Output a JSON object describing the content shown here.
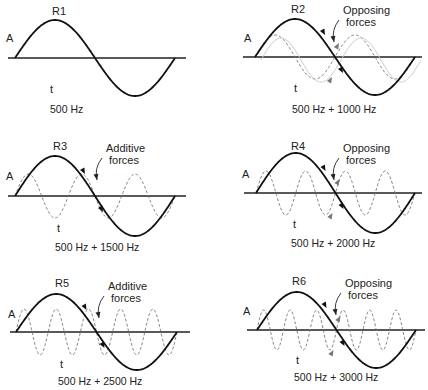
{
  "figure": {
    "panels": [
      {
        "id": "R1",
        "label": "R1",
        "amp_label": "A",
        "time_label": "t",
        "caption": "500 Hz",
        "overlay_freq_ratio": 0,
        "annotation": ""
      },
      {
        "id": "R2",
        "label": "R2",
        "amp_label": "A",
        "time_label": "t",
        "caption": "500 Hz + 1000 Hz",
        "overlay_freq_ratio": 2,
        "annotation": "Opposing forces",
        "annotation_lines": [
          "Opposing",
          "forces"
        ]
      },
      {
        "id": "R3",
        "label": "R3",
        "amp_label": "A",
        "time_label": "t",
        "caption": "500 Hz + 1500 Hz",
        "overlay_freq_ratio": 3,
        "annotation": "Additive forces",
        "annotation_lines": [
          "Additive",
          "forces"
        ]
      },
      {
        "id": "R4",
        "label": "R4",
        "amp_label": "A",
        "time_label": "t",
        "caption": "500 Hz + 2000 Hz",
        "overlay_freq_ratio": 4,
        "annotation": "Opposing forces",
        "annotation_lines": [
          "Opposing",
          "forces"
        ]
      },
      {
        "id": "R5",
        "label": "R5",
        "amp_label": "A",
        "time_label": "t",
        "caption": "500 Hz + 2500 Hz",
        "overlay_freq_ratio": 5,
        "annotation": "Additive forces",
        "annotation_lines": [
          "Additive",
          "forces"
        ]
      },
      {
        "id": "R6",
        "label": "R6",
        "amp_label": "A",
        "time_label": "t",
        "caption": "500 Hz + 3000 Hz",
        "overlay_freq_ratio": 6,
        "annotation": "Opposing forces",
        "annotation_lines": [
          "Opposing",
          "forces"
        ]
      }
    ]
  },
  "colors": {
    "fundamental": "#111111",
    "overtone": "#777777",
    "axis": "#222222",
    "text": "#222222"
  }
}
